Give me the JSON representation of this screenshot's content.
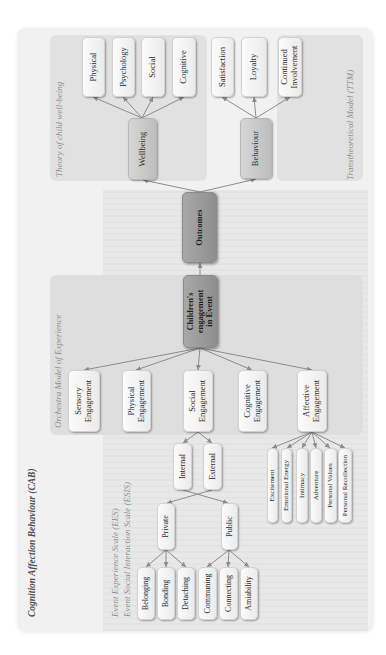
{
  "figure": {
    "framework_title": "Cognition Affection Behaviour (CAB)",
    "scale_labels": [
      "Event Experience Scale (EES)",
      "Event Social Interaction Scale (ESIS)"
    ],
    "panel_titles": {
      "theory": "Theory of child well-being",
      "ttm": "Transtheoretical Model (TTM)",
      "orchestra": "Orchestra Model of Experience"
    },
    "core": {
      "outcomes": "Outcomes",
      "childrens_engagement": [
        "Children's",
        "engagement",
        "in Event"
      ]
    },
    "outcome_branches": {
      "wellbeing": {
        "label": "Wellbeing",
        "children": [
          "Physical",
          "Psychology",
          "Social",
          "Cognitive"
        ]
      },
      "behaviour": {
        "label": "Behaviour",
        "children": [
          "Satisfaction",
          "Loyalty",
          [
            "Continued",
            "Involvement"
          ]
        ]
      }
    },
    "engagement_types": [
      [
        "Sensory",
        "Engagement"
      ],
      [
        "Physical",
        "Engagement"
      ],
      [
        "Social",
        "Engagement"
      ],
      [
        "Cognitive",
        "Engagement"
      ],
      [
        "Affective",
        "Engagement"
      ]
    ],
    "social_engagement": {
      "dimensions": [
        "Internal",
        "External"
      ],
      "private": {
        "label": "Private",
        "children": [
          "Belonging",
          "Bonding",
          "Detaching"
        ]
      },
      "public": {
        "label": "Public",
        "children": [
          "Communing",
          "Connecting",
          "Amiability"
        ]
      }
    },
    "affective_engagement": [
      "Excitement",
      "Emotional Energy",
      "Intimacy",
      "Adventure",
      "Personal Values",
      "Personal Recollection"
    ],
    "edges": [
      {
        "from": "Children's engagement in Event",
        "to": "Outcomes"
      },
      {
        "from": "Outcomes",
        "to": "Wellbeing"
      },
      {
        "from": "Outcomes",
        "to": "Behaviour"
      },
      {
        "from": "Wellbeing",
        "to": "Physical"
      },
      {
        "from": "Wellbeing",
        "to": "Psychology"
      },
      {
        "from": "Wellbeing",
        "to": "Social"
      },
      {
        "from": "Wellbeing",
        "to": "Cognitive"
      },
      {
        "from": "Behaviour",
        "to": "Satisfaction"
      },
      {
        "from": "Behaviour",
        "to": "Loyalty"
      },
      {
        "from": "Behaviour",
        "to": "Continued Involvement"
      },
      {
        "from": "Children's engagement in Event",
        "to": "Sensory Engagement"
      },
      {
        "from": "Children's engagement in Event",
        "to": "Physical Engagement"
      },
      {
        "from": "Children's engagement in Event",
        "to": "Social Engagement"
      },
      {
        "from": "Children's engagement in Event",
        "to": "Cognitive Engagement"
      },
      {
        "from": "Children's engagement in Event",
        "to": "Affective Engagement"
      },
      {
        "from": "Social Engagement",
        "to": "Internal"
      },
      {
        "from": "Social Engagement",
        "to": "External"
      },
      {
        "from": "Internal",
        "to": "Public"
      },
      {
        "from": "External",
        "to": "Private"
      },
      {
        "from": "Private",
        "to": "Belonging"
      },
      {
        "from": "Private",
        "to": "Bonding"
      },
      {
        "from": "Private",
        "to": "Detaching"
      },
      {
        "from": "Public",
        "to": "Communing"
      },
      {
        "from": "Public",
        "to": "Connecting"
      },
      {
        "from": "Public",
        "to": "Amiability"
      },
      {
        "from": "Affective Engagement",
        "to": "Excitement"
      },
      {
        "from": "Affective Engagement",
        "to": "Emotional Energy"
      },
      {
        "from": "Affective Engagement",
        "to": "Intimacy"
      },
      {
        "from": "Affective Engagement",
        "to": "Adventure"
      },
      {
        "from": "Affective Engagement",
        "to": "Personal Values"
      },
      {
        "from": "Affective Engagement",
        "to": "Personal Recollection"
      }
    ]
  },
  "colors": {
    "page_background": "#ffffff",
    "figure_background": "#f1f1f1",
    "panel_background": "#e1e1e1",
    "light_node": "#f3f3f3",
    "mid_node": "#c9c9c9",
    "dark_node": "#9b9b9b",
    "arrow": "#8c8c8c",
    "panel_title_text": "#8f8f8f"
  }
}
